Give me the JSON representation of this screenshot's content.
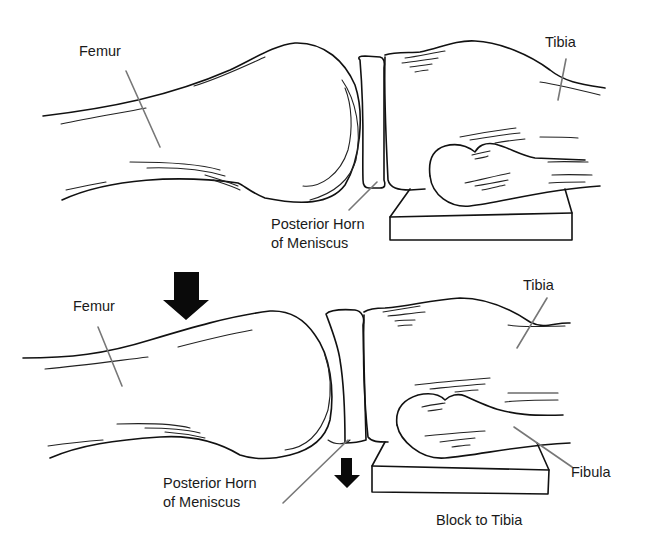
{
  "figure": {
    "top_panel": {
      "labels": {
        "femur": "Femur",
        "tibia": "Tibia",
        "meniscus_line1": "Posterior Horn",
        "meniscus_line2": "of Meniscus"
      }
    },
    "bottom_panel": {
      "labels": {
        "femur": "Femur",
        "tibia": "Tibia",
        "meniscus_line1": "Posterior Horn",
        "meniscus_line2": "of Meniscus",
        "fibula": "Fibula",
        "block": "Block to Tibia"
      },
      "arrows": [
        "force-down-on-femur",
        "tibia-displaced-down"
      ]
    }
  }
}
